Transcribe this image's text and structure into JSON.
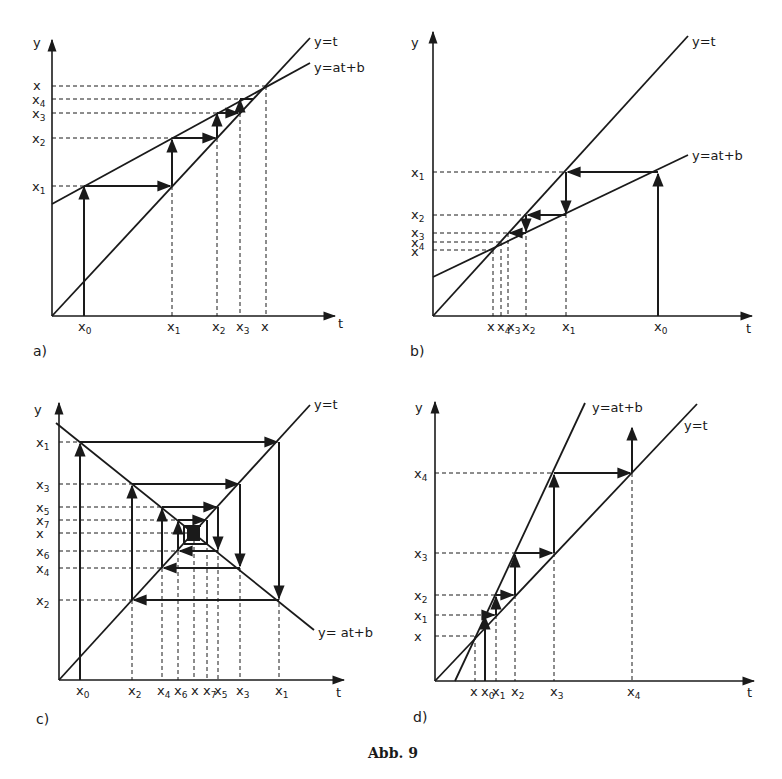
{
  "figure": {
    "caption": "Abb. 9",
    "panels": [
      {
        "id": "a",
        "panel_label": "a)",
        "axis_x": "t",
        "axis_y": "y",
        "line_labels": [
          "y=t",
          "y=at+b"
        ],
        "y_ticks": [
          "x",
          "x4",
          "x3",
          "x2",
          "x1"
        ],
        "x_ticks": [
          "x0",
          "x1",
          "x2",
          "x3",
          "x"
        ],
        "description": "monotone convergence, 0<a<1"
      },
      {
        "id": "b",
        "panel_label": "b)",
        "axis_x": "t",
        "axis_y": "y",
        "line_labels": [
          "y=t",
          "y=at+b"
        ],
        "y_ticks": [
          "x1",
          "x2",
          "x3",
          "x4",
          "x"
        ],
        "x_ticks": [
          "x",
          "x4",
          "x3",
          "x2",
          "x1",
          "x0"
        ],
        "description": "monotone convergence from above"
      },
      {
        "id": "c",
        "panel_label": "c)",
        "axis_x": "t",
        "axis_y": "y",
        "line_labels": [
          "y=t",
          "y=at+b"
        ],
        "y_ticks": [
          "x1",
          "x3",
          "x5",
          "x7",
          "x",
          "x6",
          "x4",
          "x2"
        ],
        "x_ticks": [
          "x0",
          "x2",
          "x4",
          "x6",
          "x",
          "x7",
          "x5",
          "x3",
          "x1"
        ],
        "description": "oscillating convergence, -1<a<0"
      },
      {
        "id": "d",
        "panel_label": "d)",
        "axis_x": "t",
        "axis_y": "y",
        "line_labels": [
          "y=at+b",
          "y=t"
        ],
        "y_ticks": [
          "x4",
          "x3",
          "x2",
          "x1",
          "x"
        ],
        "x_ticks": [
          "x",
          "x0",
          "x1",
          "x2",
          "x3",
          "x4"
        ],
        "description": "divergence, a>1"
      }
    ]
  }
}
